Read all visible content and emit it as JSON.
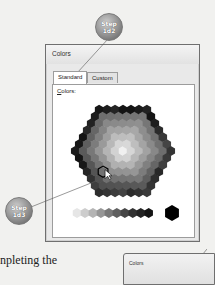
{
  "dialog": {
    "title": "Colors",
    "tabs": [
      {
        "label": "Standard",
        "active": true
      },
      {
        "label": "Custom",
        "active": false
      }
    ],
    "colors_label_underlined": "C",
    "colors_label_rest": "olors:"
  },
  "callouts": [
    {
      "line1": "Step",
      "line2": "1d2"
    },
    {
      "line1": "Step",
      "line2": "1d3"
    }
  ],
  "body_text": "npleting the",
  "second_dialog": {
    "title": "Colors"
  }
}
